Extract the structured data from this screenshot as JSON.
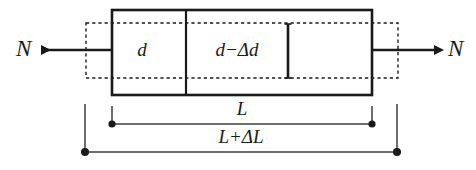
{
  "figure": {
    "type": "engineering-diagram",
    "colors": {
      "stroke": "#1a1a1a",
      "background": "#ffffff",
      "dimension_line": "#4d4d4d"
    },
    "labels": {
      "force_left": "N",
      "force_right": "N",
      "diameter_original": "d",
      "diameter_contracted": "d−Δd",
      "length_original": "L",
      "length_extended": "L+ΔL"
    },
    "elements": {
      "solid_bar": "deformed-bar-outline",
      "dashed_bar": "original-bar-outline",
      "divider": "section-divider",
      "inner_tick": "inner-diameter-marker",
      "arrow_left": "tension-force-arrow-left",
      "arrow_right": "tension-force-arrow-right",
      "dim_upper": "length-dimension-original",
      "dim_lower": "length-dimension-extended"
    }
  }
}
